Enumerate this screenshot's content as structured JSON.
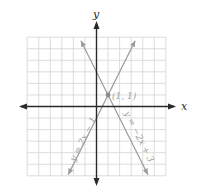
{
  "chart_data": {
    "type": "line",
    "title": "",
    "xlabel": "x",
    "ylabel": "y",
    "xlim": [
      -6,
      6
    ],
    "ylim": [
      -6,
      6
    ],
    "grid": true,
    "grid_step": 1,
    "legend": "none",
    "series": [
      {
        "name": "y = 2x − 1",
        "equation": "y = 2x - 1",
        "slope": 2,
        "intercept": -1,
        "x": [
          -2.45,
          3.35
        ],
        "y": [
          -5.9,
          5.7
        ],
        "color": "#9a9a9a"
      },
      {
        "name": "y = −2x + 3",
        "equation": "y = -2x + 3",
        "slope": -2,
        "intercept": 3,
        "x": [
          -1.35,
          4.45
        ],
        "y": [
          5.7,
          -5.9
        ],
        "color": "#9a9a9a"
      }
    ],
    "annotations": [
      {
        "type": "point",
        "x": 1,
        "y": 1,
        "label": "(1, 1)"
      }
    ]
  },
  "labels": {
    "x_axis": "x",
    "y_axis": "y",
    "point": "(1, 1)",
    "line1": "y = 2x − 1",
    "line2": "y = −2x + 3"
  },
  "colors": {
    "grid": "#d4d4d4",
    "axis": "#2a2a2a",
    "line": "#9a9a9a",
    "label": "#a0a0a0"
  }
}
